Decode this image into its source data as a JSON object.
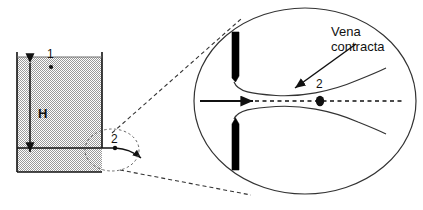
{
  "figure": {
    "colors": {
      "stroke": "#111111",
      "fluid_fill_dark": "#9a9a9a",
      "fluid_fill_light": "#ffffff",
      "plate_fill": "#000000",
      "background": "#ffffff"
    },
    "tank": {
      "head_label": "H",
      "surface_point_label": "1",
      "orifice_point_label": "2"
    },
    "detail": {
      "annotation_line1": "Vena",
      "annotation_line2": "contracta",
      "section_label": "2"
    }
  }
}
